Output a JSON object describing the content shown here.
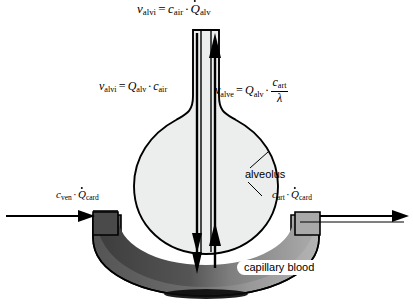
{
  "figure": {
    "colors": {
      "alveolus_fill": "#eceded",
      "capillary_dark": "#4a4a4a",
      "capillary_light": "#9d9d9d",
      "outline": "#000000",
      "background": "#ffffff"
    },
    "labels": {
      "alveolus": "alveolus",
      "capillary_blood": "capillary blood"
    },
    "equations": {
      "top": {
        "lhs_var": "v",
        "lhs_sub": "alvi",
        "rhs": [
          {
            "var": "c",
            "sub": "air",
            "dot": false
          },
          {
            "var": "Q",
            "sub": "alv",
            "dot": true
          }
        ],
        "text": "v_alvi = c_air · Q̇_alv"
      },
      "inspired": {
        "lhs_var": "v",
        "lhs_sub": "alvi",
        "rhs": [
          {
            "var": "Q",
            "sub": "alv",
            "dot": false
          },
          {
            "var": "c",
            "sub": "air",
            "dot": false
          }
        ],
        "text": "v_alvi = Q_alv · c_air"
      },
      "expired": {
        "lhs_var": "v",
        "lhs_sub": "alve",
        "factor_var": "Q",
        "factor_sub": "alv",
        "fraction_num_var": "c",
        "fraction_num_sub": "art",
        "fraction_den": "λ",
        "text": "v_alve = Q_alv · c_art / λ"
      },
      "venous": {
        "var1": "c",
        "sub1": "ven",
        "var2": "Q",
        "sub2": "card",
        "dot2": true,
        "text": "c_ven · Q̇_card"
      },
      "arterial": {
        "var1": "c",
        "sub1": "art",
        "var2": "Q",
        "sub2": "card",
        "dot2": true,
        "text": "c_art · Q̇_card"
      }
    },
    "symbols": {
      "equals": "=",
      "multiply": "·",
      "lambda": "λ"
    },
    "arrows": {
      "ventilation_in": "downward-airflow-arrow",
      "ventilation_out": "upward-airflow-arrow",
      "blood_in": "blood-inflow-arrow",
      "blood_out": "blood-outflow-arrow"
    }
  }
}
